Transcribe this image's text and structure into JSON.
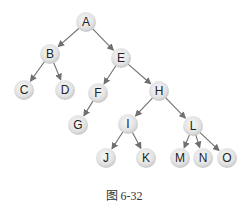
{
  "diagram": {
    "type": "binary-tree",
    "node_radius": 10,
    "colors": {
      "node_center": "#f8f8f8",
      "node_edge": "#c6c6c6",
      "edge": "#707070",
      "label": "#222222"
    },
    "nodes": [
      {
        "id": "A",
        "label": "A",
        "x": 86,
        "y": 22
      },
      {
        "id": "B",
        "label": "B",
        "x": 50,
        "y": 54
      },
      {
        "id": "E",
        "label": "E",
        "x": 121,
        "y": 58
      },
      {
        "id": "C",
        "label": "C",
        "x": 24,
        "y": 90
      },
      {
        "id": "D",
        "label": "D",
        "x": 65,
        "y": 90
      },
      {
        "id": "F",
        "label": "F",
        "x": 98,
        "y": 93
      },
      {
        "id": "H",
        "label": "H",
        "x": 159,
        "y": 91
      },
      {
        "id": "G",
        "label": "G",
        "x": 78,
        "y": 125
      },
      {
        "id": "I",
        "label": "I",
        "x": 128,
        "y": 124
      },
      {
        "id": "L",
        "label": "L",
        "x": 193,
        "y": 126
      },
      {
        "id": "J",
        "label": "J",
        "x": 106,
        "y": 158
      },
      {
        "id": "K",
        "label": "K",
        "x": 146,
        "y": 158
      },
      {
        "id": "M",
        "label": "M",
        "x": 180,
        "y": 158
      },
      {
        "id": "N",
        "label": "N",
        "x": 203,
        "y": 158
      },
      {
        "id": "O",
        "label": "O",
        "x": 227,
        "y": 158
      }
    ],
    "edges": [
      {
        "from": "A",
        "to": "B"
      },
      {
        "from": "A",
        "to": "E"
      },
      {
        "from": "B",
        "to": "C"
      },
      {
        "from": "B",
        "to": "D"
      },
      {
        "from": "E",
        "to": "F"
      },
      {
        "from": "E",
        "to": "H"
      },
      {
        "from": "F",
        "to": "G"
      },
      {
        "from": "H",
        "to": "I"
      },
      {
        "from": "H",
        "to": "L"
      },
      {
        "from": "I",
        "to": "J"
      },
      {
        "from": "I",
        "to": "K"
      },
      {
        "from": "L",
        "to": "M"
      },
      {
        "from": "L",
        "to": "N"
      },
      {
        "from": "L",
        "to": "O"
      }
    ]
  },
  "caption": "图 6-32"
}
